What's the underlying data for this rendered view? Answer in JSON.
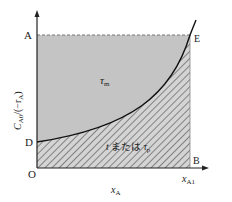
{
  "diagram": {
    "type": "reactor-design-area-plot",
    "axes": {
      "x_label": "x",
      "x_label_sub": "A",
      "y_label": "C",
      "y_label_sub": "A0",
      "y_label_rest": "/(−r",
      "y_label_rest_sub": "A",
      "y_label_close": ")",
      "origin": "O"
    },
    "points": {
      "A": "A",
      "B": "B",
      "D": "D",
      "E": "E",
      "O": "O"
    },
    "x_tick": {
      "main": "x",
      "sub": "A1"
    },
    "regions": {
      "upper_label": "τ",
      "upper_label_sub": "m",
      "lower_label_t": "t",
      "lower_label_mid": " または ",
      "lower_label_tau": "τ",
      "lower_label_tau_sub": "p"
    },
    "colors": {
      "upper_fill": "#c4c4c4",
      "lower_fill": "#d2d2d2",
      "hatch": "#555555",
      "curve": "#111111",
      "axis": "#222222",
      "dash": "#777777"
    }
  }
}
